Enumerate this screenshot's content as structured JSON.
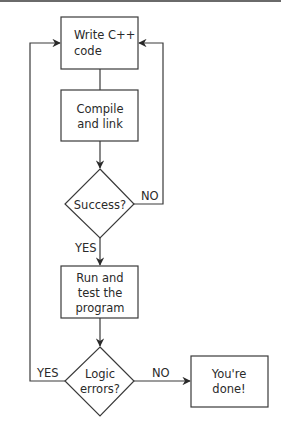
{
  "diagram": {
    "type": "flowchart",
    "colors": {
      "stroke": "#3a3a3a",
      "text": "#2a2a2a",
      "background": "#ffffff",
      "top_rule": "#6a6a6a"
    },
    "nodes": [
      {
        "id": "write",
        "shape": "rect",
        "lines": [
          "Write C++",
          "code"
        ]
      },
      {
        "id": "compile",
        "shape": "rect",
        "lines": [
          "Compile",
          "and link"
        ]
      },
      {
        "id": "success",
        "shape": "diamond",
        "lines": [
          "Success?"
        ]
      },
      {
        "id": "run",
        "shape": "rect",
        "lines": [
          "Run and",
          "test the",
          "program"
        ]
      },
      {
        "id": "logic",
        "shape": "diamond",
        "lines": [
          "Logic",
          "errors?"
        ]
      },
      {
        "id": "done",
        "shape": "rect",
        "lines": [
          "You're",
          "done!"
        ]
      }
    ],
    "edges": [
      {
        "from": "write",
        "to": "compile",
        "label": ""
      },
      {
        "from": "compile",
        "to": "success",
        "label": ""
      },
      {
        "from": "success",
        "to": "write",
        "label": "NO"
      },
      {
        "from": "success",
        "to": "run",
        "label": "YES"
      },
      {
        "from": "run",
        "to": "logic",
        "label": ""
      },
      {
        "from": "logic",
        "to": "write",
        "label": "YES"
      },
      {
        "from": "logic",
        "to": "done",
        "label": "NO"
      }
    ]
  }
}
